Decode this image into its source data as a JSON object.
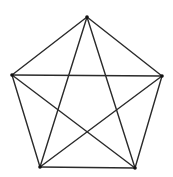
{
  "diagram": {
    "type": "complete-graph-K5",
    "stroke_color": "#2a2a2a",
    "vertex_color": "#111111",
    "background": "#ffffff",
    "vertices": [
      {
        "id": "top",
        "x": 87,
        "y": 17
      },
      {
        "id": "left",
        "x": 12,
        "y": 75
      },
      {
        "id": "right",
        "x": 162,
        "y": 76
      },
      {
        "id": "bottom-left",
        "x": 40,
        "y": 167
      },
      {
        "id": "bottom-right",
        "x": 135,
        "y": 168
      }
    ],
    "edges": [
      [
        "top",
        "left"
      ],
      [
        "top",
        "right"
      ],
      [
        "left",
        "bottom-left"
      ],
      [
        "right",
        "bottom-right"
      ],
      [
        "bottom-left",
        "bottom-right"
      ],
      [
        "left",
        "right"
      ],
      [
        "top",
        "bottom-left"
      ],
      [
        "top",
        "bottom-right"
      ],
      [
        "left",
        "bottom-right"
      ],
      [
        "right",
        "bottom-left"
      ]
    ]
  }
}
